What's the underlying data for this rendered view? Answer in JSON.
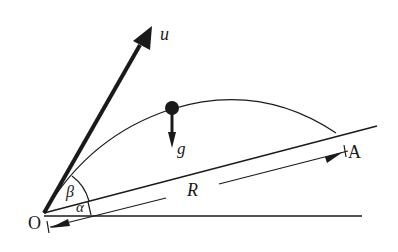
{
  "diagram": {
    "labels": {
      "velocity": "u",
      "gravity": "g",
      "range": "R",
      "origin": "O",
      "landing_point": "A",
      "launch_angle": "β",
      "incline_angle": "α"
    },
    "colors": {
      "ink": "#1a1a1a",
      "background": "#ffffff"
    }
  }
}
